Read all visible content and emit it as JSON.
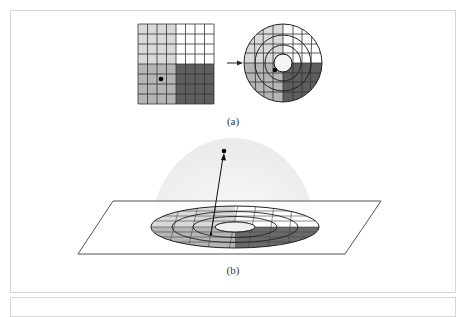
{
  "figure": {
    "panel_a": {
      "caption": "(a)",
      "square_grid": {
        "rows": 8,
        "cols": 8,
        "quadrant_shades": {
          "top_left": "#d9d9d9",
          "top_right": "#ffffff",
          "bottom_left": "#b5b5b5",
          "bottom_right": "#5e5e5e"
        }
      },
      "arrow": "right-arrow",
      "disc_grid": {
        "rings": 4,
        "quadrant_shades": {
          "top_left": "#d9d9d9",
          "top_right": "#ffffff",
          "bottom_left": "#b5b5b5",
          "bottom_right": "#5e5e5e"
        }
      }
    },
    "panel_b": {
      "caption": "(b)",
      "hemisphere_fill": "#efefef",
      "plane_stroke": "#555555"
    }
  }
}
